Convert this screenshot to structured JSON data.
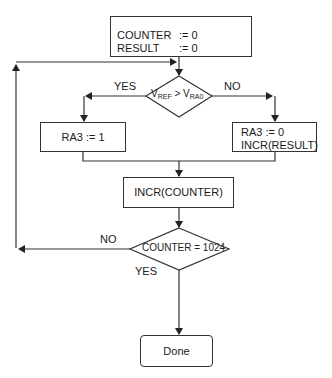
{
  "flowchart": {
    "init_box": {
      "lines": [
        {
          "var": "COUNTER",
          "assign": ":= 0"
        },
        {
          "var": "RESULT",
          "assign": ":= 0"
        }
      ]
    },
    "decision_1": {
      "left_var": "V",
      "left_sub": "REF",
      "operator": ">",
      "right_var": "V",
      "right_sub": "RA0",
      "yes_label": "YES",
      "no_label": "NO"
    },
    "yes_box": {
      "text": "RA3 := 1"
    },
    "no_box": {
      "line1": "RA3 := 0",
      "line2": "INCR(RESULT)"
    },
    "incr_box": {
      "text": "INCR(COUNTER)"
    },
    "decision_2": {
      "text": "COUNTER = 1024",
      "no_label": "NO",
      "yes_label": "YES"
    },
    "end_box": {
      "text": "Done"
    },
    "colors": {
      "line": "#333333",
      "background": "#ffffff"
    }
  }
}
